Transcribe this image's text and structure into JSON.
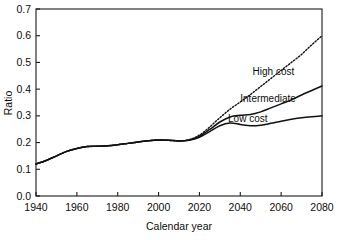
{
  "chart_data": {
    "type": "line",
    "title": "",
    "xlabel": "Calendar year",
    "ylabel": "Ratio",
    "xlim": [
      1940,
      2080
    ],
    "ylim": [
      0.0,
      0.7
    ],
    "xticks": [
      "1940",
      "1960",
      "1980",
      "2000",
      "2020",
      "2040",
      "2060",
      "2080"
    ],
    "xtick_values": [
      1940,
      1960,
      1980,
      2000,
      2020,
      2040,
      2060,
      2080
    ],
    "yticks": [
      "0.0",
      "0.1",
      "0.2",
      "0.3",
      "0.4",
      "0.5",
      "0.6",
      "0.7"
    ],
    "ytick_values": [
      0.0,
      0.1,
      0.2,
      0.3,
      0.4,
      0.5,
      0.6,
      0.7
    ],
    "grid": false,
    "legend_position": "inline-annotations",
    "x": [
      1940,
      1945,
      1950,
      1955,
      1960,
      1965,
      1970,
      1975,
      1980,
      1985,
      1990,
      1995,
      2000,
      2005,
      2010,
      2015,
      2020,
      2025,
      2030,
      2035,
      2040,
      2045,
      2050,
      2055,
      2060,
      2065,
      2070,
      2075,
      2080
    ],
    "series": [
      {
        "name": "High cost",
        "style": "dotted",
        "label": "High cost",
        "values": [
          0.12,
          0.133,
          0.15,
          0.167,
          0.178,
          0.185,
          0.186,
          0.188,
          0.192,
          0.197,
          0.202,
          0.207,
          0.21,
          0.209,
          0.206,
          0.211,
          0.228,
          0.258,
          0.293,
          0.325,
          0.352,
          0.38,
          0.41,
          0.44,
          0.47,
          0.5,
          0.53,
          0.566,
          0.6
        ]
      },
      {
        "name": "Intermediate",
        "style": "solid",
        "label": "Intermediate",
        "values": [
          0.12,
          0.133,
          0.15,
          0.167,
          0.178,
          0.185,
          0.186,
          0.188,
          0.192,
          0.197,
          0.202,
          0.207,
          0.21,
          0.209,
          0.206,
          0.21,
          0.224,
          0.249,
          0.277,
          0.296,
          0.302,
          0.305,
          0.315,
          0.33,
          0.345,
          0.36,
          0.378,
          0.395,
          0.412
        ]
      },
      {
        "name": "Low cost",
        "style": "solid",
        "label": "Low cost",
        "values": [
          0.12,
          0.133,
          0.15,
          0.167,
          0.178,
          0.185,
          0.186,
          0.188,
          0.192,
          0.197,
          0.202,
          0.207,
          0.21,
          0.209,
          0.206,
          0.209,
          0.22,
          0.241,
          0.263,
          0.273,
          0.268,
          0.263,
          0.265,
          0.272,
          0.28,
          0.287,
          0.293,
          0.297,
          0.3
        ]
      }
    ],
    "annotations": [
      {
        "text": "High cost",
        "x": 2046,
        "y": 0.452
      },
      {
        "text": "Intermediate",
        "x": 2040,
        "y": 0.352
      },
      {
        "text": "Low cost",
        "x": 2034,
        "y": 0.278
      }
    ]
  }
}
